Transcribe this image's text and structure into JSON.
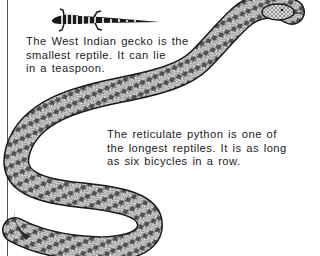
{
  "page": {
    "background": "#ffffff",
    "ink": "#1a1a1a"
  },
  "gecko": {
    "name": "West Indian gecko",
    "caption_lines": [
      "The West Indian gecko is the",
      "smallest reptile. It can lie",
      "in a teaspoon."
    ]
  },
  "python": {
    "name": "reticulate python",
    "caption_lines": [
      "The reticulate python is one of",
      "the longest reptiles. It is as long",
      "as six bicycles in a row."
    ]
  }
}
